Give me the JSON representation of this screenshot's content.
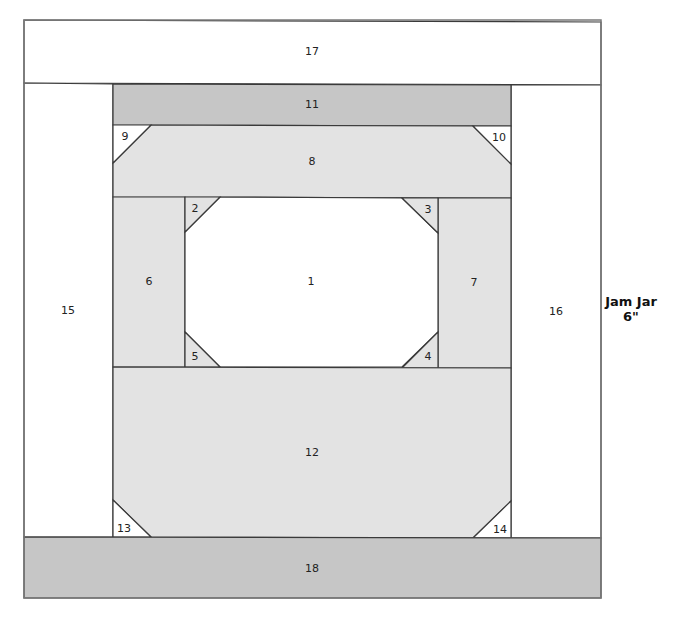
{
  "title": {
    "line1": "Jam Jar",
    "line2": "6\""
  },
  "colors": {
    "light": "#e3e3e3",
    "dark": "#c6c6c6",
    "white": "#ffffff",
    "line": "#3a3a3a"
  },
  "outer": {
    "x": 24,
    "y": 20,
    "w": 577,
    "h": 578
  },
  "pieces": [
    {
      "id": "17",
      "fill": "white",
      "points": "24,20 601,22 601,85 24,83",
      "lx": 312,
      "ly": 52
    },
    {
      "id": "15",
      "fill": "white",
      "points": "24,83 113,84 113,537 24,537",
      "lx": 68,
      "ly": 311
    },
    {
      "id": "16",
      "fill": "white",
      "points": "511,85 601,85 601,538 511,538",
      "lx": 556,
      "ly": 312
    },
    {
      "id": "11",
      "fill": "dark",
      "points": "113,84 511,85 511,126 113,125",
      "lx": 312,
      "ly": 105
    },
    {
      "id": "8",
      "fill": "light",
      "points": "151,125 473,126 511,164 511,198 113,197 113,163",
      "lx": 312,
      "ly": 162
    },
    {
      "id": "9",
      "fill": "white",
      "points": "113,125 151,125 113,163",
      "lx": 125,
      "ly": 137
    },
    {
      "id": "10",
      "fill": "white",
      "points": "473,126 511,126 511,164",
      "lx": 499,
      "ly": 138
    },
    {
      "id": "6",
      "fill": "light",
      "points": "113,197 185,197 185,367 113,367",
      "lx": 149,
      "ly": 282
    },
    {
      "id": "7",
      "fill": "light",
      "points": "438,198 511,198 511,368 438,368",
      "lx": 474,
      "ly": 283
    },
    {
      "id": "1",
      "fill": "white",
      "points": "220,197 402,198 438,233 438,332 402,367 220,367 185,332 185,232",
      "lx": 311,
      "ly": 282
    },
    {
      "id": "2",
      "fill": "light",
      "points": "185,197 220,197 185,232",
      "lx": 195,
      "ly": 209
    },
    {
      "id": "3",
      "fill": "light",
      "points": "402,198 438,198 438,233",
      "lx": 428,
      "ly": 210
    },
    {
      "id": "5",
      "fill": "light",
      "points": "185,332 220,367 185,367",
      "lx": 195,
      "ly": 357
    },
    {
      "id": "4",
      "fill": "light",
      "points": "438,332 438,368 402,368",
      "lx": 428,
      "ly": 357
    },
    {
      "id": "12",
      "fill": "light",
      "points": "113,367 511,368 511,501 473,538 151,537 113,500",
      "lx": 312,
      "ly": 453
    },
    {
      "id": "13",
      "fill": "white",
      "points": "113,500 151,537 113,537",
      "lx": 124,
      "ly": 529
    },
    {
      "id": "14",
      "fill": "white",
      "points": "511,501 511,538 473,538",
      "lx": 500,
      "ly": 530
    },
    {
      "id": "18",
      "fill": "dark",
      "points": "24,537 601,538 601,598 24,598",
      "lx": 312,
      "ly": 569
    }
  ]
}
